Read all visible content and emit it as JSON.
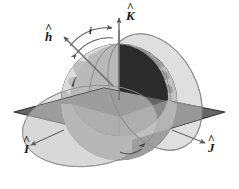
{
  "figure": {
    "name": "orbital-inclination-geometry",
    "background_color": "#ffffff",
    "width": 239,
    "height": 189
  },
  "labels": {
    "k_hat": {
      "base": "K",
      "hat": "^",
      "name": "k-hat-label"
    },
    "h_hat": {
      "base": "h",
      "hat": "^",
      "name": "h-hat-label"
    },
    "i_hat": {
      "base": "I",
      "hat": "^",
      "name": "i-hat-label"
    },
    "j_hat": {
      "base": "J",
      "hat": "^",
      "name": "j-hat-label"
    },
    "inclination": {
      "base": "i",
      "name": "inclination-angle-label"
    }
  },
  "colors": {
    "background": "#ffffff",
    "equatorial_plane": "#6b6b6b",
    "equatorial_plane_edge": "#3a3a3a",
    "orbit_ellipse_fill": "#d9d9d9",
    "orbit_ellipse_stroke": "#8a8a8a",
    "sphere_light": "#cfcfcf",
    "sphere_mid": "#9a9a9a",
    "sphere_dark": "#2c2c2c",
    "wedge_face": "#2a2a2a",
    "wedge_floor": "#7d7d7d",
    "continent": "#3f3f3f",
    "arrow": "#555555",
    "text": "#1a1a1a"
  },
  "elements": {
    "sphere": "cutaway-earth-sphere",
    "equatorial_plane": "equatorial-plane",
    "orbit_plane_left": "orbit-ellipse-left",
    "orbit_plane_right": "orbit-ellipse-right",
    "k_axis_arrow": "k-axis-arrow",
    "h_vector_arrow": "h-vector-arrow",
    "i_axis_arrow": "i-axis-arrow",
    "j_axis_arrow": "j-axis-arrow",
    "inclination_arc": "inclination-angle-arc"
  }
}
